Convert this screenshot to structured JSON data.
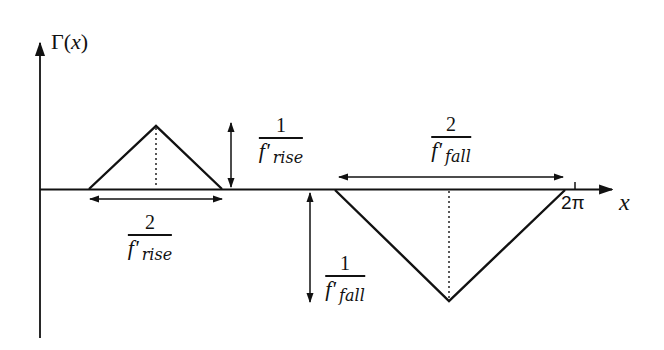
{
  "diagram": {
    "y_axis_label": {
      "symbol": "Γ",
      "open": "(",
      "var": "x",
      "close": ")"
    },
    "x_axis_label": "x",
    "x_tick_label": "2π",
    "rise_height_label": {
      "numerator": "1",
      "f": "f'",
      "sub": "rise"
    },
    "rise_width_label": {
      "numerator": "2",
      "f": "f'",
      "sub": "rise"
    },
    "fall_height_label": {
      "numerator": "1",
      "f": "f'",
      "sub": "fall"
    },
    "fall_width_label": {
      "numerator": "2",
      "f": "f'",
      "sub": "fall"
    },
    "colors": {
      "ink": "#111111",
      "background": "#ffffff"
    }
  },
  "shapes": {
    "rise_triangle": {
      "left_x": 89,
      "peak_x": 156,
      "peak_y": 126,
      "right_x": 222,
      "baseline_y": 189
    },
    "fall_triangle": {
      "left_x": 335,
      "bottom_x": 449,
      "bottom_y": 301,
      "right_x": 565,
      "baseline_y": 189
    }
  }
}
